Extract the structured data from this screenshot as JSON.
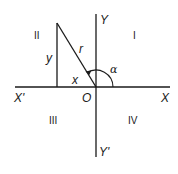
{
  "diagram": {
    "colors": {
      "stroke": "#1a1a1a",
      "background": "#ffffff"
    },
    "axes": {
      "x_positive_label": "X",
      "x_negative_label": "X'",
      "y_positive_label": "Y",
      "y_negative_label": "Y'",
      "origin_label": "O"
    },
    "quadrants": {
      "q1": "I",
      "q2": "II",
      "q3": "III",
      "q4": "IV"
    },
    "triangle": {
      "hypotenuse_label": "r",
      "vertical_leg_label": "y",
      "horizontal_leg_label": "x"
    },
    "angle": {
      "label": "α"
    }
  }
}
